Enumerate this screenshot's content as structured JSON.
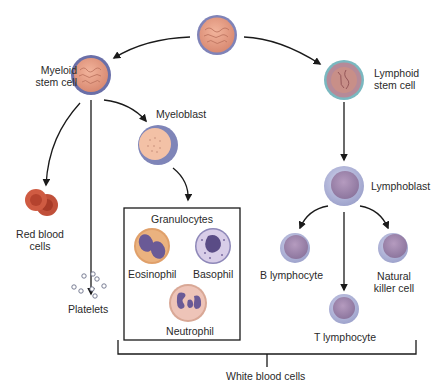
{
  "diagram": {
    "labels": {
      "myeloid_stem_cell": [
        "Myeloid",
        "stem cell"
      ],
      "lymphoid_stem_cell": [
        "Lymphoid",
        "stem cell"
      ],
      "myeloblast": "Myeloblast",
      "red_blood_cells": [
        "Red blood",
        "cells"
      ],
      "platelets": "Platelets",
      "granulocytes": "Granulocytes",
      "eosinophil": "Eosinophil",
      "basophil": "Basophil",
      "neutrophil": "Neutrophil",
      "lymphoblast": "Lymphoblast",
      "b_lymphocyte": "B lymphocyte",
      "natural_killer_cell": [
        "Natural",
        "killer cell"
      ],
      "t_lymphocyte": "T lymphocyte",
      "white_blood_cells": "White blood cells"
    },
    "colors": {
      "stem_nucleus": "#e8a48a",
      "stem_membrane": "#6a6fa8",
      "lymphoid_membrane": "#7ab8c0",
      "rbc": "#c0503a",
      "lympho_cytoplasm": "#b9bde0",
      "lympho_nucleus": "#9c86ad",
      "eosinophil_cytoplasm": "#e0a06a",
      "basophil_cytoplasm": "#d8cde8",
      "neutrophil_cytoplasm": "#eec4b8",
      "granule_nucleus": "#6a5a96",
      "arrow": "#1a1a1a"
    }
  }
}
